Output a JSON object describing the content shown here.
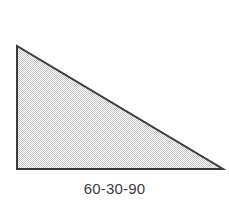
{
  "figure": {
    "type": "geometry-diagram",
    "shape_name": "right-triangle",
    "caption": "60-30-90",
    "background_color": "#ffffff",
    "outline_color": "#3a3a3a",
    "outline_width_px": 2,
    "fill_pattern": "checkerboard-stipple",
    "fill_pattern_color": "#c8c8c8",
    "fill_base_color": "#ffffff",
    "caption_color": "#3c3c3c",
    "vertices": [
      {
        "label": "top-left-apex",
        "x": 17,
        "y": 46
      },
      {
        "label": "bottom-left-right-angle",
        "x": 17,
        "y": 169
      },
      {
        "label": "bottom-right",
        "x": 223,
        "y": 169
      }
    ],
    "angles": [
      "60",
      "30",
      "90"
    ],
    "angle_separator": "-",
    "edges": [
      {
        "name": "vertical-leg",
        "from": "top-left-apex",
        "to": "bottom-left-right-angle"
      },
      {
        "name": "horizontal-leg",
        "from": "bottom-left-right-angle",
        "to": "bottom-right"
      },
      {
        "name": "hypotenuse",
        "from": "top-left-apex",
        "to": "bottom-right"
      }
    ],
    "polygon_points": "17,46 17,169 223,169"
  }
}
